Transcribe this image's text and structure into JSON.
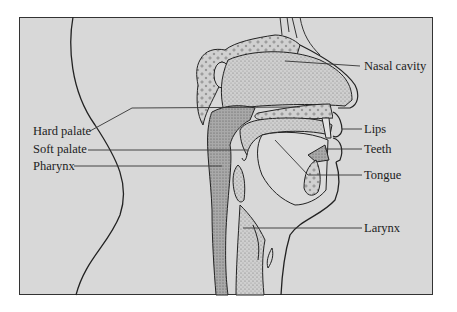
{
  "diagram": {
    "type": "anatomical-cross-section",
    "background_color": "#d8d8d8",
    "stipple_color": "#a8a8a8",
    "line_color": "#222222",
    "labels": {
      "left": [
        {
          "id": "hard_palate",
          "text": "Hard palate"
        },
        {
          "id": "soft_palate",
          "text": "Soft palate"
        },
        {
          "id": "pharynx",
          "text": "Pharynx"
        }
      ],
      "right": [
        {
          "id": "nasal_cavity",
          "text": "Nasal cavity"
        },
        {
          "id": "lips",
          "text": "Lips"
        },
        {
          "id": "teeth",
          "text": "Teeth"
        },
        {
          "id": "tongue",
          "text": "Tongue"
        },
        {
          "id": "larynx",
          "text": "Larynx"
        }
      ]
    }
  }
}
